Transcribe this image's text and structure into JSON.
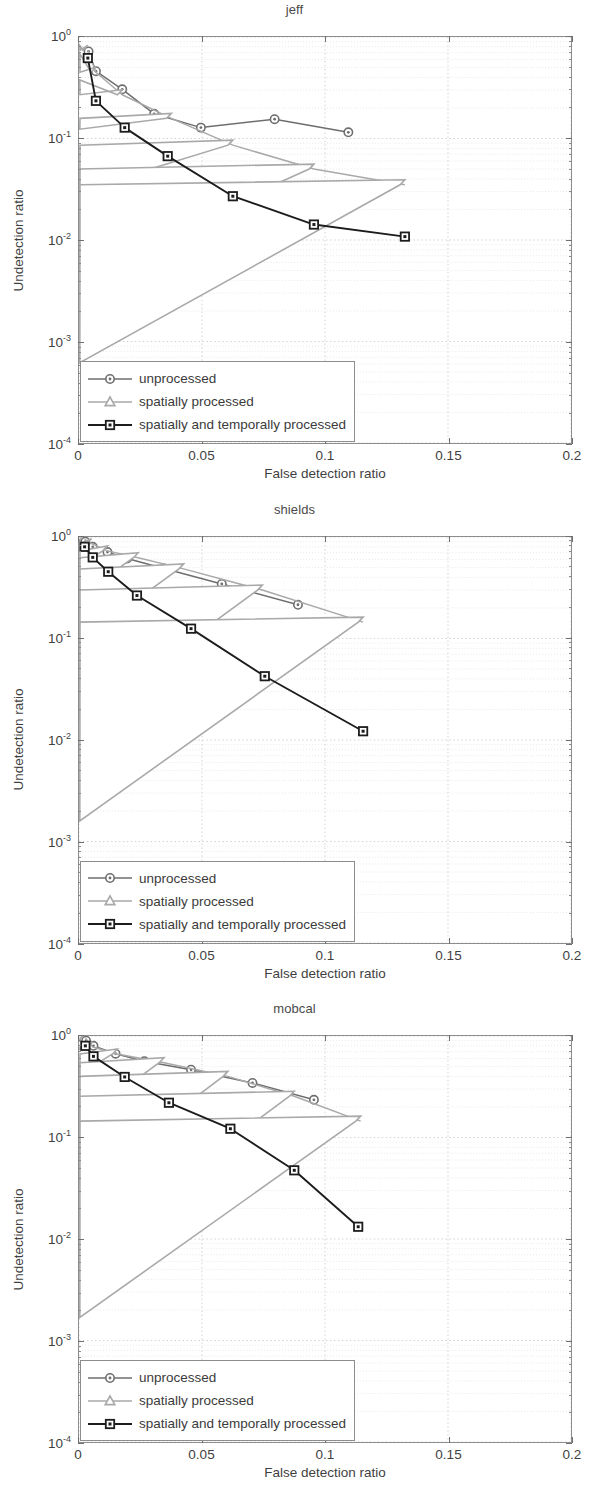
{
  "colors": {
    "unprocessed": "#6e6e6e",
    "spatially_processed": "#a9a9a9",
    "spatially_and_temporally_processed": "#1c1c1c",
    "axis": "#8d8d8d",
    "grid_major": "#c8c8c8",
    "grid_minor": "#dedede",
    "text": "#3f3f3f"
  },
  "axis": {
    "xlabel": "False detection ratio",
    "ylabel": "Undetection ratio",
    "xticks": [
      "0",
      "0.05",
      "0.1",
      "0.15",
      "0.2"
    ],
    "xtick_values": [
      0,
      0.05,
      0.1,
      0.15,
      0.2
    ],
    "yticks": [
      "10",
      "10",
      "10",
      "10",
      "10"
    ],
    "ytick_exponents": [
      "0",
      "-1",
      "-2",
      "-3",
      "-4"
    ],
    "ytick_values": [
      1,
      0.1,
      0.01,
      0.001,
      0.0001
    ],
    "xlim": [
      0,
      0.2
    ],
    "ylim": [
      0.0001,
      1
    ]
  },
  "legend": {
    "items": [
      {
        "label": "unprocessed",
        "marker": "circle",
        "color": "#6e6e6e"
      },
      {
        "label": "spatially processed",
        "marker": "triangle",
        "color": "#a9a9a9"
      },
      {
        "label": "spatially and temporally processed",
        "marker": "square",
        "color": "#1c1c1c"
      }
    ]
  },
  "chart_data": [
    {
      "type": "line",
      "title": "jeff",
      "xlabel": "False detection ratio",
      "ylabel": "Undetection ratio",
      "xlim": [
        0,
        0.2
      ],
      "ylim": [
        0.0001,
        1
      ],
      "yscale": "log",
      "grid": true,
      "legend_position": "lower-left",
      "series": [
        {
          "name": "unprocessed",
          "marker": "circle",
          "color": "#6e6e6e",
          "x": [
            0.0038,
            0.0068,
            0.0175,
            0.0305,
            0.0495,
            0.0795,
            0.1095
          ],
          "y": [
            0.72,
            0.46,
            0.305,
            0.175,
            0.128,
            0.155,
            0.115
          ]
        },
        {
          "name": "spatially processed",
          "marker": "triangle",
          "color": "#a9a9a9",
          "x": [
            0.0035,
            0.0068,
            0.0175,
            0.0375,
            0.0625,
            0.0955,
            0.1325
          ],
          "y": [
            0.74,
            0.45,
            0.27,
            0.158,
            0.086,
            0.05,
            0.035
          ]
        },
        {
          "name": "spatially and temporally processed",
          "marker": "square",
          "color": "#1c1c1c",
          "x": [
            0.0035,
            0.0068,
            0.0185,
            0.036,
            0.0625,
            0.0955,
            0.1325
          ],
          "y": [
            0.62,
            0.235,
            0.128,
            0.067,
            0.027,
            0.0142,
            0.0108
          ]
        }
      ]
    },
    {
      "type": "line",
      "title": "shields",
      "xlabel": "False detection ratio",
      "ylabel": "Undetection ratio",
      "xlim": [
        0,
        0.2
      ],
      "ylim": [
        0.0001,
        1
      ],
      "yscale": "log",
      "grid": true,
      "legend_position": "lower-left",
      "series": [
        {
          "name": "unprocessed",
          "marker": "circle",
          "color": "#6e6e6e",
          "x": [
            0.0025,
            0.0055,
            0.0115,
            0.0195,
            0.0345,
            0.058,
            0.089
          ],
          "y": [
            0.9,
            0.8,
            0.71,
            0.615,
            0.49,
            0.345,
            0.215
          ]
        },
        {
          "name": "spatially processed",
          "marker": "triangle",
          "color": "#a9a9a9",
          "x": [
            0.0022,
            0.005,
            0.0115,
            0.024,
            0.0425,
            0.0745,
            0.1155
          ],
          "y": [
            0.95,
            0.86,
            0.73,
            0.625,
            0.485,
            0.3,
            0.145
          ]
        },
        {
          "name": "spatially and temporally processed",
          "marker": "square",
          "color": "#1c1c1c",
          "x": [
            0.0022,
            0.0055,
            0.0118,
            0.0235,
            0.0455,
            0.0755,
            0.1155
          ],
          "y": [
            0.8,
            0.63,
            0.455,
            0.265,
            0.125,
            0.0425,
            0.0122
          ]
        }
      ]
    },
    {
      "type": "line",
      "title": "mobcal",
      "xlabel": "False detection ratio",
      "ylabel": "Undetection ratio",
      "xlim": [
        0,
        0.2
      ],
      "ylim": [
        0.0001,
        1
      ],
      "yscale": "log",
      "grid": true,
      "legend_position": "lower-left",
      "series": [
        {
          "name": "unprocessed",
          "marker": "circle",
          "color": "#6e6e6e",
          "x": [
            0.0028,
            0.0058,
            0.0148,
            0.0265,
            0.0455,
            0.0705,
            0.0955
          ],
          "y": [
            0.9,
            0.8,
            0.67,
            0.565,
            0.465,
            0.345,
            0.235
          ]
        },
        {
          "name": "spatially processed",
          "marker": "triangle",
          "color": "#a9a9a9",
          "x": [
            0.0025,
            0.0055,
            0.0155,
            0.0345,
            0.0605,
            0.0875,
            0.1145
          ],
          "y": [
            0.95,
            0.78,
            0.665,
            0.545,
            0.4,
            0.255,
            0.145
          ]
        },
        {
          "name": "spatially and temporally processed",
          "marker": "square",
          "color": "#1c1c1c",
          "x": [
            0.0025,
            0.0058,
            0.0185,
            0.0365,
            0.0615,
            0.0875,
            0.1135
          ],
          "y": [
            0.8,
            0.63,
            0.395,
            0.22,
            0.122,
            0.0475,
            0.0132
          ]
        }
      ]
    }
  ]
}
